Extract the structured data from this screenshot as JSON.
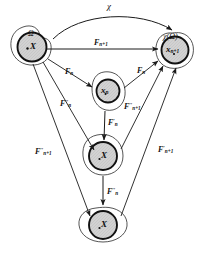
{
  "figure": {
    "chi_label": "χ",
    "nodes": [
      {
        "id": "omega",
        "set_label": "Ω",
        "point_label": "X",
        "point_sub": ""
      },
      {
        "id": "chi-omega",
        "set_label": "χ(Ω)",
        "point_label": "x",
        "point_sub": "n+1"
      },
      {
        "id": "x-n",
        "set_label": "",
        "point_label": "x",
        "point_sub": "n"
      },
      {
        "id": "x-mid",
        "set_label": "",
        "point_label": "X",
        "point_sub": ""
      },
      {
        "id": "x-bottom",
        "set_label": "",
        "point_label": "X",
        "point_sub": ""
      }
    ],
    "arrows": [
      {
        "id": "top-horizontal",
        "base": "F",
        "sub": "n+1",
        "sup": ""
      },
      {
        "id": "omega-to-xn",
        "base": "F",
        "sub": "n",
        "sup": ""
      },
      {
        "id": "xn-to-chiomega",
        "base": "F",
        "sub": "n",
        "sup": ""
      },
      {
        "id": "omega-to-xmid",
        "base": "F",
        "sub": "n",
        "sup": "′′"
      },
      {
        "id": "xmid-to-chiomega",
        "base": "F",
        "sub": "n+1",
        "sup": "′′"
      },
      {
        "id": "omega-to-xbottom",
        "base": "F",
        "sub": "n+1",
        "sup": "′′"
      },
      {
        "id": "xbottom-to-chiomega",
        "base": "F",
        "sub": "n+1",
        "sup": "′"
      },
      {
        "id": "xn-to-xmid",
        "base": "F",
        "sub": "n",
        "sup": "′"
      },
      {
        "id": "xmid-to-xbottom",
        "base": "F",
        "sub": "n",
        "sup": "′′"
      }
    ],
    "colors": {
      "stroke": "#1a1a1a",
      "fill_shade": "#cfcfcf",
      "background": "#ffffff"
    }
  }
}
